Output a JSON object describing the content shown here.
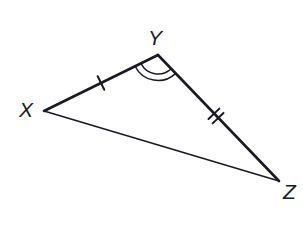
{
  "figure": {
    "kind": "geometry-diagram",
    "shape": "triangle",
    "name": "triangle-xyz",
    "background_color": "#ffffff",
    "stroke_color": "#1a1a24",
    "canvas": {
      "width": 308,
      "height": 235
    }
  },
  "vertices": [
    {
      "id": "X",
      "label": "X",
      "x": 44,
      "y": 111,
      "label_x": 19,
      "label_y": 99
    },
    {
      "id": "Y",
      "label": "Y",
      "x": 158,
      "y": 55,
      "label_x": 148,
      "label_y": 27
    },
    {
      "id": "Z",
      "label": "Z",
      "x": 279,
      "y": 181,
      "label_x": 283,
      "label_y": 181
    }
  ],
  "sides": [
    {
      "id": "XY",
      "from": "X",
      "to": "Y",
      "stroke_width": 2.6,
      "tick_marks": 1,
      "tick_center": {
        "x": 101,
        "y": 83
      },
      "congruence_group": "single-tick"
    },
    {
      "id": "YZ",
      "from": "Y",
      "to": "Z",
      "stroke_width": 2.6,
      "tick_marks": 2,
      "tick_center": {
        "x": 216,
        "y": 116
      },
      "congruence_group": "double-tick"
    },
    {
      "id": "XZ",
      "from": "X",
      "to": "Z",
      "stroke_width": 1.7,
      "tick_marks": 0,
      "congruence_group": "none"
    }
  ],
  "angle_marks": [
    {
      "id": "angle-Y",
      "at_vertex": "Y",
      "arc_count": 2,
      "radii": [
        19,
        25.5
      ],
      "stroke_width": 1.5,
      "between_sides": [
        "YX",
        "YZ"
      ]
    }
  ],
  "tick_geometry": {
    "tick_length": 15,
    "tick_stroke_width": 2,
    "double_tick_spacing": 6
  }
}
